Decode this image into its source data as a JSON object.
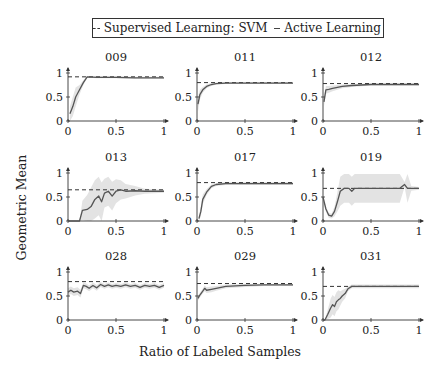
{
  "chart_data": {
    "type": "line",
    "layout": "3x3 small multiples",
    "legend": {
      "position": "top-center",
      "entries": [
        {
          "label": "Supervised Learning: SVM",
          "style": "dashed"
        },
        {
          "label": "Active Learning",
          "style": "solid"
        }
      ]
    },
    "xlabel": "Ratio of Labeled Samples",
    "ylabel": "Geometric Mean",
    "xlim": [
      0,
      1
    ],
    "ylim": [
      0,
      1
    ],
    "xticks": [
      "0",
      "0.5",
      "1"
    ],
    "yticks": [
      "0",
      "0.5",
      "1"
    ],
    "grid": false,
    "shaded_band": "variance band (light gray) around Active Learning curve",
    "panels": [
      {
        "title": "009",
        "svm": 0.92,
        "x": [
          0.02,
          0.05,
          0.08,
          0.12,
          0.16,
          0.2,
          0.3,
          0.5,
          0.7,
          1.0
        ],
        "y": [
          0.15,
          0.3,
          0.5,
          0.65,
          0.8,
          0.92,
          0.91,
          0.91,
          0.9,
          0.9
        ],
        "band": [
          0.15,
          0.2,
          0.2,
          0.1,
          0.05,
          0.02,
          0.02,
          0.02,
          0.02,
          0.02
        ]
      },
      {
        "title": "011",
        "svm": 0.8,
        "x": [
          0.01,
          0.03,
          0.06,
          0.1,
          0.15,
          0.2,
          0.3,
          0.5,
          0.7,
          1.0
        ],
        "y": [
          0.35,
          0.55,
          0.65,
          0.72,
          0.76,
          0.78,
          0.79,
          0.79,
          0.79,
          0.79
        ],
        "band": [
          0.15,
          0.1,
          0.06,
          0.04,
          0.03,
          0.02,
          0.02,
          0.02,
          0.02,
          0.02
        ]
      },
      {
        "title": "012",
        "svm": 0.78,
        "x": [
          0.01,
          0.03,
          0.06,
          0.1,
          0.15,
          0.2,
          0.3,
          0.5,
          0.7,
          1.0
        ],
        "y": [
          0.4,
          0.65,
          0.66,
          0.68,
          0.7,
          0.72,
          0.74,
          0.76,
          0.76,
          0.76
        ],
        "band": [
          0.1,
          0.08,
          0.07,
          0.06,
          0.05,
          0.04,
          0.03,
          0.02,
          0.02,
          0.02
        ]
      },
      {
        "title": "013",
        "svm": 0.65,
        "x": [
          0.0,
          0.12,
          0.15,
          0.2,
          0.24,
          0.28,
          0.32,
          0.35,
          0.38,
          0.42,
          0.46,
          0.5,
          0.55,
          0.6,
          0.7,
          0.8,
          0.9,
          1.0
        ],
        "y": [
          0.0,
          0.0,
          0.22,
          0.24,
          0.3,
          0.45,
          0.52,
          0.4,
          0.58,
          0.62,
          0.52,
          0.62,
          0.65,
          0.62,
          0.63,
          0.62,
          0.62,
          0.62
        ],
        "band": [
          0.0,
          0.0,
          0.2,
          0.3,
          0.4,
          0.4,
          0.4,
          0.4,
          0.3,
          0.3,
          0.3,
          0.25,
          0.2,
          0.15,
          0.1,
          0.05,
          0.04,
          0.03
        ]
      },
      {
        "title": "017",
        "svm": 0.8,
        "x": [
          0.02,
          0.04,
          0.06,
          0.1,
          0.15,
          0.2,
          0.3,
          0.5,
          0.7,
          1.0
        ],
        "y": [
          0.05,
          0.2,
          0.45,
          0.6,
          0.72,
          0.76,
          0.78,
          0.78,
          0.78,
          0.78
        ],
        "band": [
          0.05,
          0.1,
          0.1,
          0.06,
          0.04,
          0.03,
          0.03,
          0.03,
          0.03,
          0.03
        ]
      },
      {
        "title": "019",
        "svm": 0.68,
        "x": [
          0.0,
          0.03,
          0.06,
          0.09,
          0.12,
          0.15,
          0.18,
          0.22,
          0.27,
          0.3,
          0.33,
          0.5,
          0.8,
          0.85,
          0.88,
          0.92,
          1.0
        ],
        "y": [
          0.5,
          0.25,
          0.12,
          0.1,
          0.2,
          0.4,
          0.62,
          0.68,
          0.68,
          0.62,
          0.68,
          0.68,
          0.68,
          0.76,
          0.68,
          0.68,
          0.68
        ],
        "band": [
          0.0,
          0.05,
          0.05,
          0.05,
          0.1,
          0.2,
          0.3,
          0.3,
          0.3,
          0.3,
          0.3,
          0.3,
          0.3,
          0.05,
          0.3,
          0.05,
          0.03
        ]
      },
      {
        "title": "028",
        "svm": 0.8,
        "x": [
          0.0,
          0.03,
          0.06,
          0.1,
          0.13,
          0.16,
          0.19,
          0.22,
          0.26,
          0.3,
          0.34,
          0.38,
          0.42,
          0.46,
          0.5,
          0.55,
          0.6,
          0.65,
          0.7,
          0.75,
          0.8,
          0.85,
          0.9,
          0.95,
          1.0
        ],
        "y": [
          0.58,
          0.62,
          0.58,
          0.6,
          0.55,
          0.72,
          0.7,
          0.66,
          0.72,
          0.67,
          0.74,
          0.7,
          0.73,
          0.7,
          0.72,
          0.7,
          0.73,
          0.7,
          0.72,
          0.68,
          0.72,
          0.7,
          0.72,
          0.68,
          0.72
        ],
        "band": [
          0.08,
          0.08,
          0.08,
          0.08,
          0.08,
          0.06,
          0.06,
          0.06,
          0.06,
          0.06,
          0.05,
          0.05,
          0.05,
          0.05,
          0.05,
          0.05,
          0.05,
          0.05,
          0.05,
          0.05,
          0.05,
          0.05,
          0.05,
          0.05,
          0.05
        ]
      },
      {
        "title": "029",
        "svm": 0.76,
        "x": [
          0.01,
          0.03,
          0.06,
          0.08,
          0.1,
          0.15,
          0.2,
          0.3,
          0.5,
          0.7,
          1.0
        ],
        "y": [
          0.45,
          0.52,
          0.6,
          0.66,
          0.62,
          0.64,
          0.66,
          0.7,
          0.72,
          0.73,
          0.73
        ],
        "band": [
          0.05,
          0.05,
          0.05,
          0.06,
          0.06,
          0.06,
          0.05,
          0.04,
          0.03,
          0.02,
          0.02
        ]
      },
      {
        "title": "031",
        "svm": 0.7,
        "x": [
          0.0,
          0.02,
          0.05,
          0.08,
          0.1,
          0.12,
          0.14,
          0.16,
          0.18,
          0.2,
          0.23,
          0.26,
          0.3,
          0.5,
          0.7,
          1.0
        ],
        "y": [
          0.0,
          0.0,
          0.12,
          0.25,
          0.32,
          0.28,
          0.38,
          0.42,
          0.45,
          0.5,
          0.55,
          0.65,
          0.7,
          0.7,
          0.7,
          0.7
        ],
        "band": [
          0.0,
          0.0,
          0.1,
          0.2,
          0.2,
          0.2,
          0.2,
          0.2,
          0.15,
          0.12,
          0.1,
          0.05,
          0.04,
          0.04,
          0.04,
          0.04
        ]
      }
    ]
  }
}
